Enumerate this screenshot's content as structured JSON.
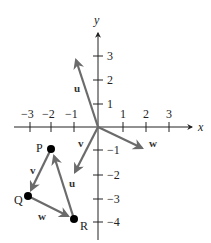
{
  "diagram": {
    "title": "",
    "axes": {
      "x_label": "x",
      "y_label": "y",
      "x_ticks": [
        "−3",
        "−2",
        "−1",
        "1",
        "2",
        "3"
      ],
      "y_ticks_pos": [
        "1",
        "2",
        "3"
      ],
      "y_ticks_neg": [
        "−1",
        "−2",
        "−3",
        "−4"
      ]
    },
    "vectors": [
      {
        "name": "u",
        "from": [
          0,
          0
        ],
        "to": [
          -1,
          3
        ],
        "label": "u"
      },
      {
        "name": "v",
        "from": [
          0,
          0
        ],
        "to": [
          -1,
          -2
        ],
        "label": "v"
      },
      {
        "name": "w",
        "from": [
          0,
          0
        ],
        "to": [
          2,
          -1
        ],
        "label": "w"
      }
    ],
    "points": [
      {
        "label": "P",
        "coord": [
          -2,
          -1
        ]
      },
      {
        "label": "Q",
        "coord": [
          -3,
          -3
        ]
      },
      {
        "label": "R",
        "coord": [
          -1,
          -4
        ]
      }
    ],
    "triangle_edges": [
      {
        "from": "P",
        "to": "Q",
        "label": "v"
      },
      {
        "from": "Q",
        "to": "R",
        "label": "w"
      },
      {
        "from": "R",
        "to": "P",
        "label": "u"
      }
    ],
    "colors": {
      "vector": "#6b6b6b",
      "axis": "#222222",
      "point": "#000000"
    }
  }
}
